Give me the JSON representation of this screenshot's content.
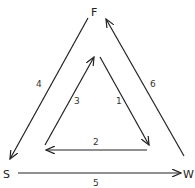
{
  "diagram": {
    "nodes": [
      {
        "id": "F",
        "label": "F",
        "x": 95,
        "y": 16
      },
      {
        "id": "S",
        "label": "S",
        "x": 7,
        "y": 178
      },
      {
        "id": "W",
        "label": "W",
        "x": 188,
        "y": 178
      }
    ],
    "edges": [
      {
        "id": "1",
        "label": "1",
        "from": "inner-top",
        "to": "inner-right",
        "direction": "down-right"
      },
      {
        "id": "2",
        "label": "2",
        "from": "inner-right",
        "to": "inner-left",
        "direction": "left"
      },
      {
        "id": "3",
        "label": "3",
        "from": "inner-left",
        "to": "inner-top",
        "direction": "up-right"
      },
      {
        "id": "4",
        "label": "4",
        "from": "F",
        "to": "S",
        "direction": "down-left"
      },
      {
        "id": "5",
        "label": "5",
        "from": "S",
        "to": "W",
        "direction": "right"
      },
      {
        "id": "6",
        "label": "6",
        "from": "W",
        "to": "F",
        "direction": "up-left"
      }
    ],
    "color": "#222222"
  }
}
